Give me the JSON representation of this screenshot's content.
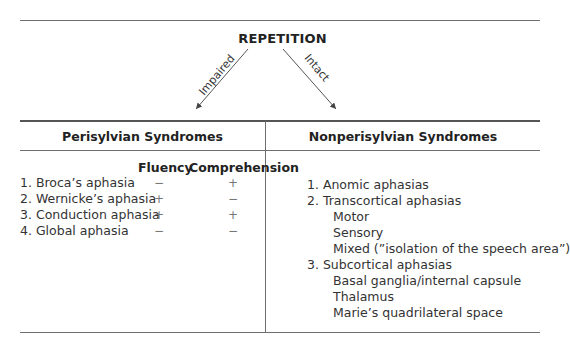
{
  "diagram": {
    "root": "REPETITION",
    "branches": [
      {
        "label": "Impaired",
        "target": "Perisylvian Syndromes"
      },
      {
        "label": "Intact",
        "target": "Nonperisylvian Syndromes"
      }
    ]
  },
  "left_column": {
    "heading": "Perisylvian Syndromes",
    "subheaders": [
      "Fluency",
      "Comprehension"
    ],
    "rows": [
      {
        "name": "1. Broca’s aphasia",
        "fluency": "−",
        "comprehension": "+"
      },
      {
        "name": "2. Wernicke’s aphasia",
        "fluency": "+",
        "comprehension": "−"
      },
      {
        "name": "3. Conduction aphasia",
        "fluency": "+",
        "comprehension": "+"
      },
      {
        "name": "4. Global aphasia",
        "fluency": "−",
        "comprehension": "−"
      }
    ]
  },
  "right_column": {
    "heading": "Nonperisylvian Syndromes",
    "items": [
      {
        "text": "1. Anomic aphasias",
        "level": 0
      },
      {
        "text": "2. Transcortical aphasias",
        "level": 0
      },
      {
        "text": "Motor",
        "level": 1
      },
      {
        "text": "Sensory",
        "level": 1
      },
      {
        "text": "Mixed (”isolation of the speech area”)",
        "level": 1
      },
      {
        "text": "3. Subcortical aphasias",
        "level": 0
      },
      {
        "text": "Basal ganglia/internal capsule",
        "level": 1
      },
      {
        "text": "Thalamus",
        "level": 1
      },
      {
        "text": "Marie’s quadrilateral space",
        "level": 1
      }
    ]
  }
}
